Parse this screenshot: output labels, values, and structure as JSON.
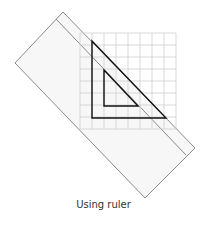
{
  "caption": "Using ruler",
  "colors": {
    "grid": "#cfcfcf",
    "ruler_outline": "#8a8a8a",
    "ruler_fill": "#f6f6f6",
    "triangle": "#111111"
  },
  "figure": {
    "grid": {
      "x0": 80,
      "y0": 33,
      "cols": 8,
      "rows": 8,
      "cell": 12
    },
    "ruler": {
      "corners": [
        [
          63,
          12
        ],
        [
          195,
          148
        ],
        [
          145,
          198
        ],
        [
          15,
          63
        ]
      ],
      "stripe": [
        [
          56,
          19
        ],
        [
          186,
          155
        ]
      ]
    },
    "outer_triangle": [
      [
        92,
        41
      ],
      [
        92,
        118
      ],
      [
        166,
        118
      ]
    ],
    "inner_triangle": [
      [
        104,
        70
      ],
      [
        104,
        106
      ],
      [
        138,
        106
      ]
    ]
  }
}
